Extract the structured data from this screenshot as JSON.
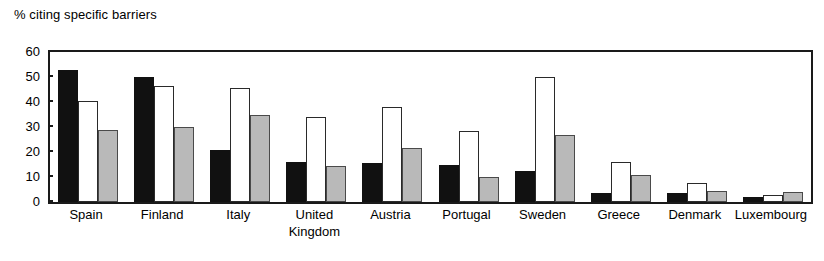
{
  "chart_data": {
    "type": "bar",
    "title": "% citing specific barriers",
    "xlabel": "",
    "ylabel": "",
    "ylim": [
      0,
      60
    ],
    "yticks": [
      0,
      10,
      20,
      30,
      40,
      50,
      60
    ],
    "grid": false,
    "legend": "none",
    "categories": [
      "Spain",
      "Finland",
      "Italy",
      "United\nKingdom",
      "Austria",
      "Portugal",
      "Sweden",
      "Greece",
      "Denmark",
      "Luxembourg"
    ],
    "series": [
      {
        "name": "series-1",
        "color": "#111111",
        "values": [
          53,
          50,
          21,
          16,
          15.5,
          15,
          12.5,
          3.5,
          3.5,
          2
        ]
      },
      {
        "name": "series-2",
        "color": "#ffffff",
        "values": [
          40.5,
          46.5,
          45.5,
          34,
          38,
          28.5,
          50,
          16,
          7.5,
          3
        ]
      },
      {
        "name": "series-3",
        "color": "#b9b9b9",
        "values": [
          29,
          30,
          35,
          14.5,
          21.5,
          10,
          27,
          11,
          4.5,
          4
        ]
      }
    ]
  }
}
